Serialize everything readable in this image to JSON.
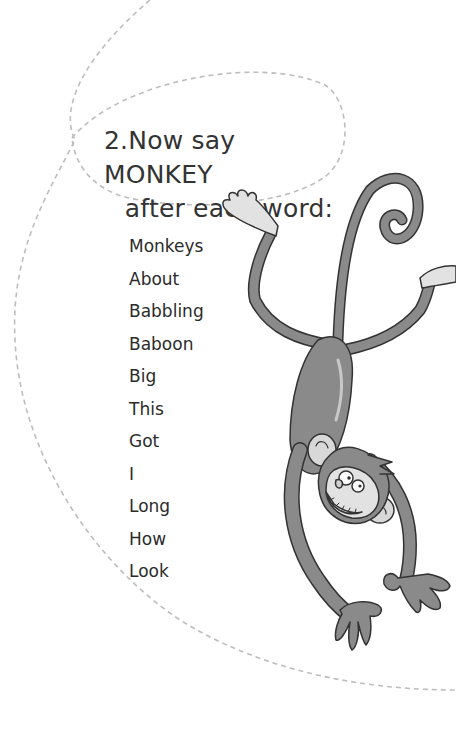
{
  "heading": {
    "number": "2.",
    "line1": "Now say MONKEY",
    "line2": "after each word:"
  },
  "words": [
    "Monkeys",
    "About",
    "Babbling",
    "Baboon",
    "Big",
    "This",
    "Got",
    "I",
    "Long",
    "How",
    "Look"
  ],
  "illustration": {
    "subject": "cartoon monkey hanging upside down by its tail",
    "body_color": "#8a8a8a",
    "face_color": "#e2e2e2"
  },
  "colors": {
    "text": "#2b2b2b",
    "dashed_line": "#bdbdbd",
    "background": "#ffffff"
  }
}
